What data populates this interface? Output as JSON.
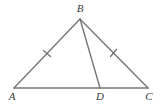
{
  "figure": {
    "kind": "geometry-diagram",
    "background_color": "#ffffff",
    "stroke_color": "#77777a",
    "label_color": "#3a3a3a",
    "canvas": {
      "width": 160,
      "height": 104
    },
    "points": {
      "A": {
        "label": "A",
        "x": 14,
        "y": 88,
        "label_x": 12,
        "label_y": 100
      },
      "B": {
        "label": "B",
        "x": 80,
        "y": 19,
        "label_x": 80,
        "label_y": 12
      },
      "C": {
        "label": "C",
        "x": 148,
        "y": 88,
        "label_x": 149,
        "label_y": 100
      },
      "D": {
        "label": "D",
        "x": 100,
        "y": 88,
        "label_x": 100,
        "label_y": 100
      }
    },
    "segments": [
      {
        "name": "segment-AB",
        "from": "A",
        "to": "B",
        "x1": 14,
        "y1": 88,
        "x2": 80,
        "y2": 19
      },
      {
        "name": "segment-BC",
        "from": "B",
        "to": "C",
        "x1": 80,
        "y1": 19,
        "x2": 148,
        "y2": 88
      },
      {
        "name": "segment-AC",
        "from": "A",
        "to": "C",
        "x1": 14,
        "y1": 88,
        "x2": 148,
        "y2": 88
      },
      {
        "name": "segment-BD",
        "from": "B",
        "to": "D",
        "x1": 80,
        "y1": 19,
        "x2": 100,
        "y2": 88
      }
    ],
    "tick_marks": [
      {
        "name": "tick-on-AB",
        "on_segment": "segment-AB",
        "cx": 47,
        "cy": 53.5,
        "x1": 43.5,
        "y1": 50.5,
        "x2": 50.5,
        "y2": 56.5
      },
      {
        "name": "tick-on-BC",
        "on_segment": "segment-BC",
        "cx": 113.5,
        "cy": 53,
        "x1": 110.5,
        "y1": 56.5,
        "x2": 116.5,
        "y2": 49.5
      }
    ],
    "stroke_width": 1.4,
    "tick_stroke_width": 1.2
  }
}
